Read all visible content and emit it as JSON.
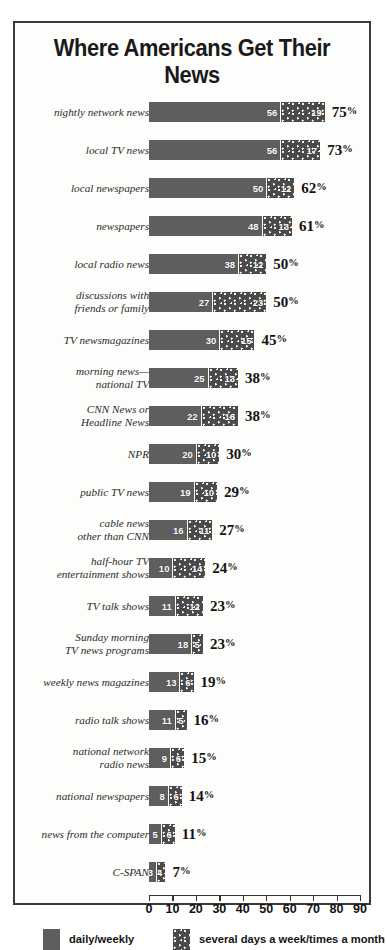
{
  "chart_data": {
    "type": "bar",
    "subtype": "stacked-horizontal",
    "title": "Where Americans Get Their News",
    "xlabel": "",
    "ylabel": "",
    "xlim": [
      0,
      90
    ],
    "xticks": [
      0,
      10,
      20,
      30,
      40,
      50,
      60,
      70,
      80,
      90
    ],
    "grid": false,
    "legend_position": "bottom",
    "series": [
      {
        "name": "daily/weekly",
        "color": "#5e5e5e",
        "values": [
          56,
          56,
          50,
          48,
          38,
          27,
          30,
          25,
          22,
          20,
          19,
          16,
          10,
          11,
          18,
          13,
          11,
          9,
          8,
          5,
          3
        ]
      },
      {
        "name": "several days a week/times a month",
        "color": "#4a4a4a",
        "values": [
          19,
          17,
          12,
          13,
          12,
          23,
          15,
          13,
          16,
          10,
          10,
          11,
          14,
          12,
          5,
          6,
          5,
          6,
          6,
          6,
          4
        ]
      }
    ],
    "categories": [
      "nightly network news",
      "local TV news",
      "local newspapers",
      "newspapers",
      "local radio news",
      "discussions with\nfriends or family",
      "TV newsmagazines",
      "morning news—\nnational TV",
      "CNN News or\nHeadline News",
      "NPR",
      "public TV news",
      "cable news\nother than CNN",
      "half-hour TV\nentertainment shows",
      "TV talk shows",
      "Sunday morning\nTV news programs",
      "weekly news magazines",
      "radio talk shows",
      "national network\nradio news",
      "national newspapers",
      "news from the computer",
      "C-SPAN"
    ],
    "totals": [
      75,
      73,
      62,
      61,
      50,
      50,
      45,
      38,
      38,
      30,
      29,
      27,
      24,
      23,
      23,
      19,
      16,
      15,
      14,
      11,
      7
    ],
    "total_suffix": "%"
  },
  "rows": [
    {
      "label": "nightly network news",
      "daily": 56,
      "several": 19,
      "total": "75",
      "pct": "%"
    },
    {
      "label": "local TV news",
      "daily": 56,
      "several": 17,
      "total": "73",
      "pct": "%"
    },
    {
      "label": "local newspapers",
      "daily": 50,
      "several": 12,
      "total": "62",
      "pct": "%"
    },
    {
      "label": "newspapers",
      "daily": 48,
      "several": 13,
      "total": "61",
      "pct": "%"
    },
    {
      "label": "local radio news",
      "daily": 38,
      "several": 12,
      "total": "50",
      "pct": "%"
    },
    {
      "label": "discussions with\nfriends or family",
      "daily": 27,
      "several": 23,
      "total": "50",
      "pct": "%"
    },
    {
      "label": "TV newsmagazines",
      "daily": 30,
      "several": 15,
      "total": "45",
      "pct": "%"
    },
    {
      "label": "morning news—\nnational TV",
      "daily": 25,
      "several": 13,
      "total": "38",
      "pct": "%"
    },
    {
      "label": "CNN News or\nHeadline News",
      "daily": 22,
      "several": 16,
      "total": "38",
      "pct": "%"
    },
    {
      "label": "NPR",
      "daily": 20,
      "several": 10,
      "total": "30",
      "pct": "%"
    },
    {
      "label": "public TV news",
      "daily": 19,
      "several": 10,
      "total": "29",
      "pct": "%"
    },
    {
      "label": "cable news\nother than CNN",
      "daily": 16,
      "several": 11,
      "total": "27",
      "pct": "%"
    },
    {
      "label": "half-hour TV\nentertainment shows",
      "daily": 10,
      "several": 14,
      "total": "24",
      "pct": "%"
    },
    {
      "label": "TV talk shows",
      "daily": 11,
      "several": 12,
      "total": "23",
      "pct": "%"
    },
    {
      "label": "Sunday morning\nTV news programs",
      "daily": 18,
      "several": 5,
      "total": "23",
      "pct": "%"
    },
    {
      "label": "weekly news magazines",
      "daily": 13,
      "several": 6,
      "total": "19",
      "pct": "%"
    },
    {
      "label": "radio talk shows",
      "daily": 11,
      "several": 5,
      "total": "16",
      "pct": "%"
    },
    {
      "label": "national network\nradio news",
      "daily": 9,
      "several": 6,
      "total": "15",
      "pct": "%"
    },
    {
      "label": "national newspapers",
      "daily": 8,
      "several": 6,
      "total": "14",
      "pct": "%"
    },
    {
      "label": "news from the computer",
      "daily": 5,
      "several": 6,
      "total": "11",
      "pct": "%"
    },
    {
      "label": "C-SPAN",
      "daily": 3,
      "several": 4,
      "total": "7",
      "pct": "%"
    }
  ],
  "axis": {
    "ticks": [
      "0",
      "10",
      "20",
      "30",
      "40",
      "50",
      "60",
      "70",
      "80",
      "90"
    ],
    "min": 0,
    "max": 90
  },
  "legend": {
    "items": [
      {
        "label": "daily/weekly",
        "style": "solid"
      },
      {
        "label": "several days a week/times a month",
        "style": "dotted"
      }
    ]
  },
  "colors": {
    "daily": "#5e5e5e",
    "several": "#4a4a4a",
    "frame": "#3a3a3a",
    "text": "#1a1a1a"
  }
}
